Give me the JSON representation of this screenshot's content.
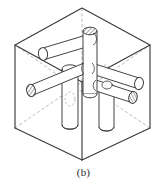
{
  "figure": {
    "caption": "(b)",
    "type": "isometric-line-drawing",
    "colors": {
      "background": "#ffffff",
      "line": "#3a3a3a",
      "hidden_line": "#8a8a8a",
      "hatch": "#555555",
      "caption": "#2c2c2c"
    },
    "line_widths": {
      "box_edge": 1.1,
      "cylinder": 0.9,
      "hidden": 0.7
    },
    "box": {
      "label": "cube-wireframe",
      "top": {
        "x": 82,
        "y": 8
      },
      "left": {
        "x": 15,
        "y": 45
      },
      "right": {
        "x": 150,
        "y": 45
      },
      "front": {
        "x": 82,
        "y": 82
      },
      "bottom_left": {
        "x": 15,
        "y": 128
      },
      "bottom_right": {
        "x": 150,
        "y": 128
      },
      "bottom_front": {
        "x": 82,
        "y": 160
      },
      "back": {
        "x": 82,
        "y": 8,
        "hidden_vertex": {
          "x": 82,
          "y": 92
        }
      }
    },
    "rods": [
      {
        "name": "vertical-rod-back",
        "axis": "vertical",
        "end_cap": "hatched",
        "description": "tall rod rising through the top face, hatched elliptical cap at top"
      },
      {
        "name": "vertical-rod-left",
        "axis": "vertical",
        "end_cap": "plain",
        "description": "rod descending to the bottom face on the left"
      },
      {
        "name": "vertical-rod-right",
        "axis": "vertical",
        "end_cap": "plain",
        "description": "rod descending to the bottom face on the right"
      },
      {
        "name": "horizontal-rod-upper-left",
        "axis": "x",
        "end_cap": "plain",
        "description": "rod entering from the upper-left face"
      },
      {
        "name": "horizontal-rod-lower-left",
        "axis": "x",
        "end_cap": "hatched",
        "description": "rod protruding from the left face with hatched cap"
      },
      {
        "name": "horizontal-rod-upper-right",
        "axis": "y",
        "end_cap": "plain",
        "description": "rod entering from the upper-right face"
      },
      {
        "name": "horizontal-rod-lower-right",
        "axis": "y",
        "end_cap": "hatched",
        "description": "rod protruding toward the lower right with hatched cap"
      }
    ]
  }
}
